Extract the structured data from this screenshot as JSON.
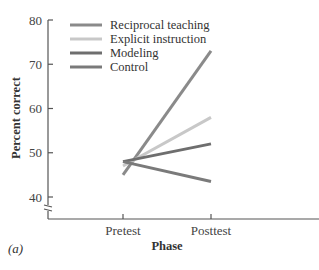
{
  "chart_data": {
    "type": "line",
    "title": "",
    "panel_label": "(a)",
    "xlabel": "Phase",
    "ylabel": "Percent correct",
    "categories": [
      "Pretest",
      "Posttest"
    ],
    "ylim": [
      35,
      80
    ],
    "yticks": [
      40,
      50,
      60,
      70,
      80
    ],
    "axis_break": true,
    "grid": false,
    "legend_position": "upper left",
    "series": [
      {
        "name": "Reciprocal teaching",
        "values": [
          45,
          73
        ],
        "color": "#8a8a8a"
      },
      {
        "name": "Explicit instruction",
        "values": [
          47,
          58
        ],
        "color": "#c8c8c8"
      },
      {
        "name": "Modeling",
        "values": [
          48,
          52
        ],
        "color": "#6e6e6e"
      },
      {
        "name": "Control",
        "values": [
          48,
          43.5
        ],
        "color": "#7a7a7a"
      }
    ]
  }
}
